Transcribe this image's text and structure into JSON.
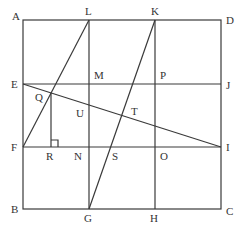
{
  "diagram": {
    "type": "geometry-figure",
    "colors": {
      "stroke": "#3a3a3a",
      "label": "#333333",
      "background": "#ffffff"
    },
    "points": {
      "A": {
        "label": "A",
        "x": 23,
        "y": 20
      },
      "D": {
        "label": "D",
        "x": 221,
        "y": 20
      },
      "B": {
        "label": "B",
        "x": 23,
        "y": 209
      },
      "C": {
        "label": "C",
        "x": 221,
        "y": 209
      },
      "L": {
        "label": "L",
        "x": 89,
        "y": 20
      },
      "K": {
        "label": "K",
        "x": 155,
        "y": 20
      },
      "G": {
        "label": "G",
        "x": 89,
        "y": 209
      },
      "H": {
        "label": "H",
        "x": 155,
        "y": 209
      },
      "E": {
        "label": "E",
        "x": 23,
        "y": 84
      },
      "J": {
        "label": "J",
        "x": 221,
        "y": 84
      },
      "F": {
        "label": "F",
        "x": 23,
        "y": 147
      },
      "I": {
        "label": "I",
        "x": 221,
        "y": 147
      },
      "M": {
        "label": "M",
        "x": 89,
        "y": 84
      },
      "P": {
        "label": "P",
        "x": 155,
        "y": 84
      },
      "N": {
        "label": "N",
        "x": 89,
        "y": 147
      },
      "O": {
        "label": "O",
        "x": 155,
        "y": 147
      },
      "Q": {
        "label": "Q",
        "x": 51,
        "y": 93
      },
      "R": {
        "label": "R",
        "x": 51,
        "y": 147
      },
      "S": {
        "label": "S",
        "x": 111,
        "y": 147
      },
      "T": {
        "label": "T",
        "x": 121,
        "y": 115
      },
      "U": {
        "label": "U",
        "x": 89,
        "y": 105
      }
    },
    "segments": [
      [
        "A",
        "D"
      ],
      [
        "D",
        "C"
      ],
      [
        "C",
        "B"
      ],
      [
        "B",
        "A"
      ],
      [
        "L",
        "G"
      ],
      [
        "K",
        "H"
      ],
      [
        "E",
        "J"
      ],
      [
        "F",
        "I"
      ],
      [
        "F",
        "L"
      ],
      [
        "G",
        "K"
      ],
      [
        "E",
        "I"
      ],
      [
        "Q",
        "R"
      ]
    ],
    "right_angle_marker": {
      "at": "R",
      "between": [
        "Q",
        "N"
      ]
    }
  }
}
